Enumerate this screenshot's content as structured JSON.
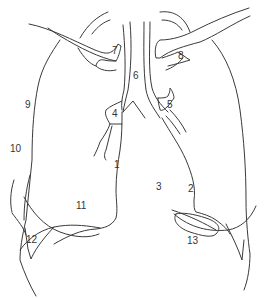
{
  "diagram": {
    "type": "anatomical line drawing (chest radiograph tracing)",
    "stroke_color": "#3a3a3a",
    "label_color": "#333333",
    "background": "#ffffff",
    "labels": [
      {
        "id": "1",
        "text": "1",
        "x": 114,
        "y": 168
      },
      {
        "id": "2",
        "text": "2",
        "x": 188,
        "y": 192
      },
      {
        "id": "3",
        "text": "3",
        "x": 156,
        "y": 190
      },
      {
        "id": "4",
        "text": "4",
        "x": 112,
        "y": 117
      },
      {
        "id": "5",
        "text": "5",
        "x": 167,
        "y": 108
      },
      {
        "id": "6",
        "text": "6",
        "x": 133,
        "y": 79
      },
      {
        "id": "7",
        "text": "7",
        "x": 112,
        "y": 54
      },
      {
        "id": "8",
        "text": "8",
        "x": 178,
        "y": 59
      },
      {
        "id": "9",
        "text": "9",
        "x": 25,
        "y": 108
      },
      {
        "id": "10",
        "text": "10",
        "x": 10,
        "y": 152
      },
      {
        "id": "11",
        "text": "11",
        "x": 76,
        "y": 209
      },
      {
        "id": "12",
        "text": "12",
        "x": 26,
        "y": 243
      },
      {
        "id": "13",
        "text": "13",
        "x": 187,
        "y": 244
      }
    ]
  }
}
